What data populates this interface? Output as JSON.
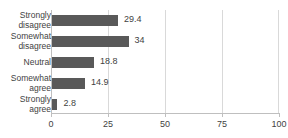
{
  "chart": {
    "title_clipped": "",
    "background": "#ffffff",
    "bar_color": "#595959",
    "grid_color": "#d9d9d9",
    "axis_color": "#bfbfbf",
    "text_color": "#3f3f3f"
  },
  "chart_data": {
    "type": "bar",
    "orientation": "horizontal",
    "title": "",
    "xlabel": "",
    "ylabel": "",
    "xlim": [
      0,
      100
    ],
    "xticks": [
      0,
      25,
      50,
      75,
      100
    ],
    "xtick_labels": [
      "0",
      "25",
      "50",
      "75",
      "100"
    ],
    "grid": true,
    "grid_axis": "x",
    "legend": false,
    "categories": [
      "Strongly disagree",
      "Somewhat disagree",
      "Neutral",
      "Somewhat agree",
      "Strongly agree"
    ],
    "category_lines": [
      [
        "Strongly",
        "disagree"
      ],
      [
        "Somewhat",
        "disagree"
      ],
      [
        "Neutral"
      ],
      [
        "Somewhat",
        "agree"
      ],
      [
        "Strongly",
        "agree"
      ]
    ],
    "values": [
      29.4,
      34,
      18.8,
      14.9,
      2.8
    ],
    "value_labels": [
      "29.4",
      "34",
      "18.8",
      "14.9",
      "2.8"
    ]
  }
}
